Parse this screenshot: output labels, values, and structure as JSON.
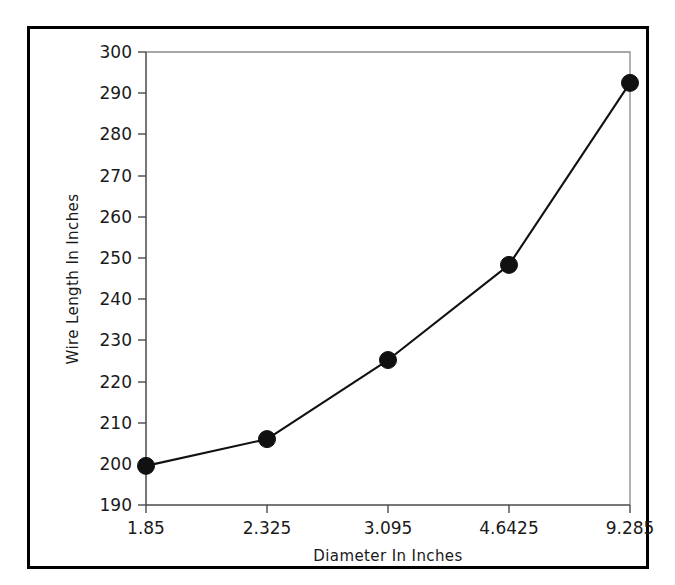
{
  "figure": {
    "background_color": "#ffffff",
    "border_color": "#000000"
  },
  "chart_data": {
    "type": "line",
    "title": "",
    "xlabel": "Diameter In Inches",
    "ylabel": "Wire Length In Inches",
    "categories": [
      "1.85",
      "2.325",
      "3.095",
      "4.6425",
      "9.285"
    ],
    "values": [
      199.5,
      206.0,
      225.2,
      248.3,
      292.5
    ],
    "series": [
      {
        "name": "Wire Length",
        "values": [
          199.5,
          206.0,
          225.2,
          248.3,
          292.5
        ],
        "color": "#111111",
        "marker": "circle"
      }
    ],
    "yticks": [
      190,
      200,
      210,
      220,
      230,
      240,
      250,
      260,
      270,
      280,
      290,
      300
    ],
    "ytick_labels": [
      "190",
      "200",
      "210",
      "220",
      "230",
      "240",
      "250",
      "260",
      "270",
      "280",
      "290",
      "300"
    ],
    "xtick_labels": [
      "1.85",
      "2.325",
      "3.095",
      "4.6425",
      "9.285"
    ],
    "ylim": [
      190,
      300
    ],
    "xlim": [
      0,
      4
    ],
    "grid": false,
    "legend": false,
    "legend_position": "none"
  }
}
